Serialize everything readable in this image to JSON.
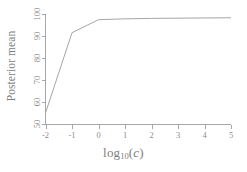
{
  "figure": {
    "background_color": "#ffffff",
    "line_color": "#a6a6a6",
    "axis_color": "#9d9d9d",
    "text_color": "#7e7e7e"
  },
  "labels": {
    "ylabel": "Posterior mean",
    "xlabel_base": "log",
    "xlabel_sub": "10",
    "xlabel_paren_open": "(",
    "xlabel_var": "c",
    "xlabel_paren_close": ")"
  },
  "chart_data": {
    "type": "line",
    "title": "",
    "xlabel": "log10(c)",
    "ylabel": "Posterior mean",
    "x": [
      -2,
      -1,
      0,
      1,
      2,
      3,
      4,
      5
    ],
    "values": [
      55.0,
      91.5,
      97.4,
      97.8,
      98.0,
      98.1,
      98.2,
      98.3
    ],
    "xlim": [
      -2,
      5
    ],
    "ylim": [
      50,
      100
    ],
    "xticks": [
      -2,
      -1,
      0,
      1,
      2,
      3,
      4,
      5
    ],
    "xtick_labels": [
      "-2",
      "-1",
      "0",
      "1",
      "2",
      "3",
      "4",
      "5"
    ],
    "yticks": [
      50,
      60,
      70,
      80,
      90,
      100
    ],
    "ytick_labels": [
      "50",
      "60",
      "70",
      "80",
      "90",
      "100"
    ],
    "grid": false,
    "legend": false,
    "legend_position": "none",
    "series": [
      {
        "name": "Posterior mean",
        "values": [
          55.0,
          91.5,
          97.4,
          97.8,
          98.0,
          98.1,
          98.2,
          98.3
        ]
      }
    ]
  }
}
